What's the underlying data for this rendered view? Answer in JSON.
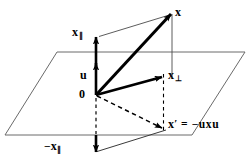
{
  "figure": {
    "name": "vector-reflection-diagram",
    "colors": {
      "ink": "#000000",
      "plane_outline": "#666666",
      "construction_line": "#555555",
      "background": "#ffffff"
    }
  },
  "labels": {
    "x_parallel": {
      "base": "x",
      "sub": "∥"
    },
    "u": {
      "base": "u"
    },
    "origin": {
      "base": "0"
    },
    "x": {
      "base": "x"
    },
    "x_perp": {
      "base": "x",
      "sub": "⊥"
    },
    "x_prime": {
      "base": "x",
      "prime": "′"
    },
    "equation": {
      "equals": "=",
      "minus": "−",
      "rhs": "uxu"
    },
    "neg_x_parallel": {
      "minus": "−",
      "base": "x",
      "sub": "∥"
    }
  },
  "geometry": {
    "plane": {
      "type": "parallelogram",
      "points": "57,52 245,52 192,135 5,135"
    },
    "origin_point": {
      "x": 96,
      "y": 95
    },
    "vectors": [
      {
        "name": "u",
        "from": [
          96,
          95
        ],
        "to": [
          96,
          62
        ],
        "style": "solid-bold-arrow"
      },
      {
        "name": "x_parallel",
        "from": [
          96,
          62
        ],
        "to": [
          96,
          36
        ],
        "style": "solid-bold-arrow"
      },
      {
        "name": "x",
        "from": [
          96,
          95
        ],
        "to": [
          172,
          13
        ],
        "style": "solid-bold-arrow"
      },
      {
        "name": "x_perp",
        "from": [
          96,
          95
        ],
        "to": [
          163,
          76
        ],
        "style": "solid-bold-arrow"
      },
      {
        "name": "x_prime",
        "from": [
          96,
          95
        ],
        "to": [
          163,
          128
        ],
        "style": "dashed-arrow"
      },
      {
        "name": "neg_x_parallel",
        "from": [
          96,
          136
        ],
        "to": [
          96,
          152
        ],
        "style": "solid-bold-arrow"
      }
    ],
    "construction_lines": [
      {
        "name": "x-par-to-x",
        "from": [
          99,
          36
        ],
        "to": [
          172,
          15
        ]
      },
      {
        "name": "x-vertical-drop",
        "from": [
          172,
          15
        ],
        "to": [
          172,
          76
        ]
      },
      {
        "name": "origin-to-x-par-top",
        "from": [
          96,
          36
        ],
        "to": [
          96,
          62
        ]
      },
      {
        "name": "neg-x-par-to-x-prime",
        "from": [
          96,
          152
        ],
        "to": [
          166,
          130
        ]
      },
      {
        "name": "x-prime-dashed-vertical",
        "from": [
          163,
          78
        ],
        "to": [
          163,
          130
        ]
      },
      {
        "name": "origin-dashed-drop",
        "from": [
          96,
          97
        ],
        "to": [
          96,
          136
        ]
      }
    ]
  }
}
